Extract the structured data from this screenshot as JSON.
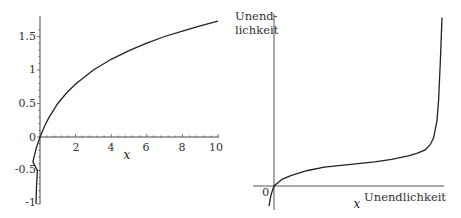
{
  "chart_data": [
    {
      "type": "line",
      "title": "",
      "xlabel": "x",
      "ylabel": "",
      "xlim": [
        0,
        10
      ],
      "ylim": [
        -1,
        1.75
      ],
      "grid": false,
      "x_ticks": [
        "2",
        "4",
        "6",
        "8",
        "10"
      ],
      "y_ticks": [
        "-1",
        "-0.5",
        "0",
        "0.5",
        "1",
        "1.5"
      ],
      "series": [
        {
          "name": "curve",
          "x": [
            -0.4,
            -0.3,
            -0.2,
            -0.1,
            0,
            0.25,
            0.5,
            1,
            1.5,
            2,
            3,
            4,
            5,
            6,
            7,
            8,
            9,
            10
          ],
          "values": [
            -0.37,
            -0.26,
            -0.16,
            -0.08,
            0,
            0.16,
            0.29,
            0.5,
            0.66,
            0.79,
            1.0,
            1.16,
            1.29,
            1.4,
            1.5,
            1.58,
            1.66,
            1.73
          ]
        }
      ]
    },
    {
      "type": "line",
      "title": "",
      "xlabel": "x",
      "ylabel": "",
      "x_axis_end_label": "Unendlichkeit",
      "y_axis_end_label": [
        "Unend-",
        "lichkeit"
      ],
      "origin_label": "0",
      "grid": false,
      "series": [
        {
          "name": "curve",
          "description": "rises from below origin, flattens, then shoots to infinity near right end",
          "x": [
            0.0,
            0.05,
            0.1,
            0.2,
            0.3,
            0.4,
            0.5,
            0.6,
            0.7,
            0.8,
            0.85,
            0.9,
            0.93,
            0.95,
            0.97,
            0.98,
            0.99,
            1.0
          ],
          "values": [
            0.0,
            0.04,
            0.06,
            0.09,
            0.11,
            0.12,
            0.13,
            0.14,
            0.155,
            0.175,
            0.19,
            0.21,
            0.24,
            0.28,
            0.38,
            0.5,
            0.72,
            0.98
          ]
        }
      ]
    }
  ],
  "left": {
    "xlabel": "x",
    "x_ticks": [
      "2",
      "4",
      "6",
      "8",
      "10"
    ],
    "y_ticks": [
      "1.5",
      "1",
      "0.5",
      "0",
      "-0.5",
      "-1"
    ]
  },
  "right": {
    "xlabel": "x",
    "x_end": "Unendlichkeit",
    "y_end_1": "Unend-",
    "y_end_2": "lichkeit",
    "origin": "0"
  }
}
